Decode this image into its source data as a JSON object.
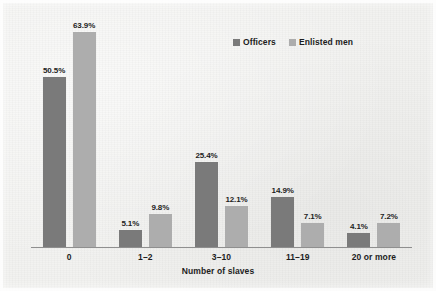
{
  "figure": {
    "background_color": "#f2f2f0"
  },
  "chart_data": {
    "type": "bar",
    "title": "",
    "subtitle": "",
    "xlabel": "Number of slaves",
    "ylabel": "",
    "ylim": [
      0,
      70
    ],
    "grid": false,
    "legend_position": "top-right",
    "value_format": "percent",
    "categories": [
      "0",
      "1–2",
      "3–10",
      "11–19",
      "20 or more"
    ],
    "series": [
      {
        "name": "Officers",
        "color": "#7a7a7a",
        "values": [
          50.5,
          5.1,
          25.4,
          14.9,
          4.1
        ],
        "labels": [
          "50.5%",
          "5.1%",
          "25.4%",
          "14.9%",
          "4.1%"
        ]
      },
      {
        "name": "Enlisted men",
        "color": "#adadad",
        "values": [
          63.9,
          9.8,
          12.1,
          7.1,
          7.2
        ],
        "labels": [
          "63.9%",
          "9.8%",
          "12.1%",
          "7.1%",
          "7.2%"
        ]
      }
    ]
  },
  "legend": {
    "entries": [
      {
        "label": "Officers",
        "color": "#7a7a7a"
      },
      {
        "label": "Enlisted men",
        "color": "#adadad"
      }
    ]
  }
}
